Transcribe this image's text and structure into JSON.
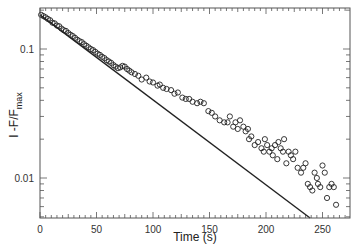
{
  "chart_data": {
    "type": "scatter",
    "title": "",
    "xlabel": "Time (s)",
    "ylabel": "1 -F/F",
    "ylabel_subscript": "max",
    "xlim": [
      0,
      274
    ],
    "ylim": [
      0.0049,
      0.208
    ],
    "yscale": "log",
    "grid": false,
    "legend": null,
    "x_ticks": [
      0,
      50,
      100,
      150,
      200,
      250
    ],
    "x_tick_labels": [
      "0",
      "50",
      "100",
      "150",
      "200",
      "250"
    ],
    "y_ticks": [
      0.1,
      0.01
    ],
    "y_tick_labels": [
      "0.1",
      "0.01"
    ],
    "series": [
      {
        "name": "data",
        "kind": "scatter",
        "marker": "open-circle",
        "x": [
          1,
          3,
          5,
          7,
          9,
          11,
          13,
          15,
          17,
          19,
          21,
          23,
          25,
          27,
          29,
          31,
          33,
          35,
          37,
          39,
          41,
          43,
          45,
          47,
          49,
          51,
          53,
          55,
          57,
          59,
          61,
          63,
          65,
          67,
          69,
          71,
          73,
          75,
          77,
          79,
          81,
          84,
          87,
          90,
          94,
          97,
          100,
          104,
          106,
          109,
          112,
          116,
          119,
          122,
          126,
          129,
          132,
          135,
          139,
          142,
          145,
          149,
          152,
          155,
          159,
          163,
          166,
          168,
          171,
          173,
          175,
          177,
          180,
          182,
          184,
          185,
          187,
          190,
          193,
          196,
          198,
          199,
          201,
          203,
          205,
          206,
          208,
          210,
          211,
          213,
          215,
          216,
          218,
          220,
          222,
          224,
          226,
          228,
          231,
          233,
          235,
          237,
          239,
          241,
          243,
          245,
          246,
          248,
          250,
          252,
          254,
          256,
          258,
          260,
          262
        ],
        "y": [
          0.184,
          0.18,
          0.176,
          0.171,
          0.167,
          0.16,
          0.158,
          0.152,
          0.15,
          0.144,
          0.14,
          0.138,
          0.133,
          0.129,
          0.126,
          0.122,
          0.118,
          0.115,
          0.113,
          0.109,
          0.106,
          0.103,
          0.1,
          0.098,
          0.095,
          0.092,
          0.09,
          0.087,
          0.085,
          0.082,
          0.08,
          0.078,
          0.075,
          0.073,
          0.071,
          0.072,
          0.074,
          0.073,
          0.07,
          0.068,
          0.066,
          0.064,
          0.062,
          0.058,
          0.06,
          0.056,
          0.055,
          0.052,
          0.053,
          0.05,
          0.049,
          0.048,
          0.045,
          0.046,
          0.042,
          0.041,
          0.041,
          0.039,
          0.038,
          0.039,
          0.038,
          0.033,
          0.032,
          0.03,
          0.028,
          0.027,
          0.027,
          0.03,
          0.025,
          0.027,
          0.024,
          0.028,
          0.025,
          0.023,
          0.024,
          0.02,
          0.021,
          0.018,
          0.019,
          0.017,
          0.016,
          0.02,
          0.018,
          0.016,
          0.017,
          0.015,
          0.018,
          0.014,
          0.019,
          0.017,
          0.016,
          0.02,
          0.013,
          0.016,
          0.015,
          0.014,
          0.016,
          0.012,
          0.011,
          0.012,
          0.013,
          0.009,
          0.0085,
          0.008,
          0.011,
          0.01,
          0.009,
          0.0085,
          0.0125,
          0.011,
          0.007,
          0.0085,
          0.009,
          0.0085,
          0.0062
        ]
      },
      {
        "name": "fit",
        "kind": "line",
        "x": [
          0,
          239
        ],
        "y": [
          0.184,
          0.0049
        ]
      }
    ]
  },
  "axes": {
    "xlabel": "Time (s)",
    "ylabel_main": "I -F/F",
    "ylabel_sub": "max"
  }
}
